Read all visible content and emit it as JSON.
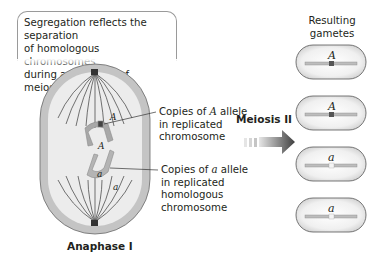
{
  "callout": {
    "line1": "Segregation reflects the separation",
    "line2": "of homologous chromosomes",
    "line3": "during anaphase I of meiosis."
  },
  "cell": {
    "stage_label": "Anaphase I",
    "upper_allele_marks": [
      "A",
      "A"
    ],
    "lower_allele_marks": [
      "a",
      "a"
    ]
  },
  "labels": {
    "upper": {
      "pre": "Copies of ",
      "allele": "A",
      "post": " allele",
      "line2": "in replicated",
      "line3": "chromosome"
    },
    "lower": {
      "pre": "Copies of ",
      "allele": "a",
      "post": " allele",
      "line2": "in replicated",
      "line3": "homologous",
      "line4": "chromosome"
    }
  },
  "arrow": {
    "label": "Meiosis II"
  },
  "gametes": {
    "title_line1": "Resulting",
    "title_line2": "gametes",
    "items": [
      {
        "allele": "A",
        "marker_color": "#555555"
      },
      {
        "allele": "A",
        "marker_color": "#555555"
      },
      {
        "allele": "a",
        "marker_color": "#f2f2f2"
      },
      {
        "allele": "a",
        "marker_color": "#f2f2f2"
      }
    ]
  },
  "colors": {
    "cell_fill": "#c9c9c9",
    "cell_inner": "#ededed",
    "chromosome": "#a8a8a8",
    "marker_dark": "#555555",
    "arrow": "#5a5a5a"
  }
}
